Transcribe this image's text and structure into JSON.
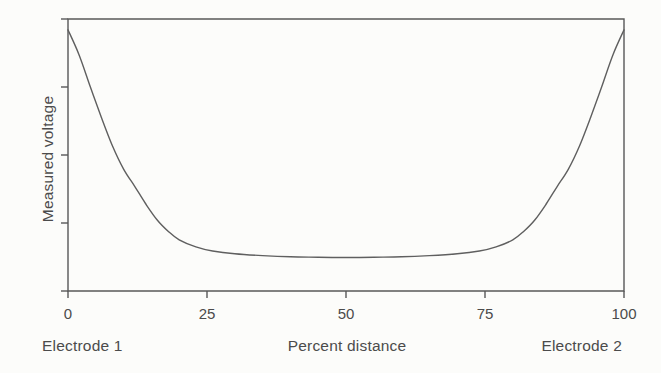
{
  "figure": {
    "background": "#fcfcfa",
    "axis_color": "#585858",
    "line_color": "#5f5f5f",
    "text_color": "#4b4b4b"
  },
  "chart_data": {
    "type": "line",
    "title": "",
    "xlabel": "Percent distance",
    "ylabel": "Measured voltage",
    "x_axis_annotations": {
      "left": "Electrode 1",
      "right": "Electrode 2"
    },
    "xlim": [
      0,
      100
    ],
    "ylim": [
      0,
      1
    ],
    "x_ticks": [
      0,
      25,
      50,
      75,
      100
    ],
    "x_tick_labels": [
      "0",
      "25",
      "50",
      "75",
      "100"
    ],
    "y_ticks_normalized": [
      0,
      0.25,
      0.5,
      0.75,
      1
    ],
    "y_tick_labels_shown": false,
    "y_unit": "arbitrary",
    "grid": false,
    "legend": false,
    "plot_frame": "full-box",
    "series": [
      {
        "name": "Measured voltage between electrodes",
        "x": [
          0,
          2,
          4,
          6,
          8,
          10,
          12,
          14,
          16,
          18,
          20,
          23,
          26,
          30,
          35,
          40,
          45,
          50,
          55,
          60,
          65,
          70,
          74,
          77,
          80,
          82,
          84,
          86,
          88,
          90,
          92,
          94,
          96,
          98,
          100
        ],
        "y": [
          0.96,
          0.868,
          0.752,
          0.638,
          0.533,
          0.448,
          0.385,
          0.32,
          0.262,
          0.22,
          0.188,
          0.162,
          0.147,
          0.137,
          0.13,
          0.126,
          0.124,
          0.123,
          0.124,
          0.126,
          0.13,
          0.137,
          0.147,
          0.162,
          0.188,
          0.22,
          0.262,
          0.32,
          0.385,
          0.448,
          0.533,
          0.638,
          0.752,
          0.868,
          0.96
        ]
      }
    ],
    "shape_note": "U-shaped curve: voltage highest at both electrodes, flat minimum plateau across the middle"
  }
}
